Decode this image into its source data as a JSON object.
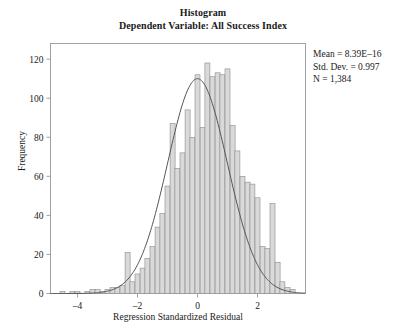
{
  "chart_data": {
    "type": "bar",
    "title": "Histogram",
    "subtitle": "Dependent Variable: All Success Index",
    "xlabel": "Regression Standardized Residual",
    "ylabel": "Frequency",
    "xlim": [
      -4.9,
      3.6
    ],
    "ylim": [
      0,
      128
    ],
    "xticks": [
      -4,
      -2,
      0,
      2
    ],
    "xtick_labels": [
      "–4",
      "–2",
      "0",
      "2"
    ],
    "yticks": [
      0,
      20,
      40,
      60,
      80,
      100,
      120
    ],
    "ytick_labels": [
      "0",
      "20",
      "40",
      "60",
      "80",
      "100",
      "120"
    ],
    "grid": false,
    "legend": false,
    "bin_width": 0.1667,
    "bin_centers": [
      -4.5,
      -4.33,
      -4.17,
      -4.0,
      -3.83,
      -3.67,
      -3.5,
      -3.33,
      -3.17,
      -3.0,
      -2.83,
      -2.67,
      -2.5,
      -2.33,
      -2.17,
      -2.0,
      -1.83,
      -1.67,
      -1.5,
      -1.33,
      -1.17,
      -1.0,
      -0.83,
      -0.67,
      -0.5,
      -0.33,
      -0.17,
      0.0,
      0.17,
      0.33,
      0.5,
      0.67,
      0.83,
      1.0,
      1.17,
      1.33,
      1.5,
      1.67,
      1.83,
      2.0,
      2.17,
      2.33,
      2.5,
      2.67,
      2.83,
      3.0,
      3.17
    ],
    "values": [
      1,
      0,
      1,
      1,
      0,
      1,
      2,
      2,
      1,
      2,
      3,
      3,
      4,
      21,
      6,
      10,
      13,
      18,
      24,
      34,
      41,
      55,
      87,
      64,
      72,
      94,
      80,
      112,
      85,
      118,
      111,
      113,
      112,
      115,
      86,
      73,
      60,
      57,
      56,
      49,
      24,
      23,
      46,
      16,
      6,
      3,
      2
    ],
    "normal_curve": {
      "mean": -0.0,
      "std_dev": 0.997,
      "n": 1384,
      "peak_frequency": 110
    },
    "annotations": {
      "mean": "Mean = 8.39E–16",
      "std_dev": "Std. Dev. = 0.997",
      "n": "N = 1,384"
    },
    "colors": {
      "bar_fill": "#d9d9d9",
      "bar_stroke": "#8a8a8a",
      "curve": "#555555",
      "axis": "#999999",
      "text": "#1a1a1a"
    }
  }
}
